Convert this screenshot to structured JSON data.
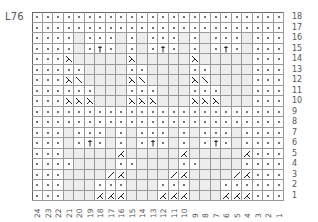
{
  "chart": {
    "label": "L76",
    "columns": 24,
    "rows": 18,
    "legend_codes": {
      "p": "purl-dot",
      "e": "empty-knit",
      "t": "arrow-up",
      "S": "left-decrease-symbol",
      "b": "backslash",
      "K": "right-decrease-symbol",
      "f": "forward-slash"
    },
    "row_labels": [
      "18",
      "17",
      "16",
      "15",
      "14",
      "13",
      "12",
      "11",
      "10",
      "9",
      "8",
      "7",
      "6",
      "5",
      "4",
      "3",
      "2",
      "1"
    ],
    "column_labels": [
      "24",
      "23",
      "22",
      "21",
      "20",
      "19",
      "18",
      "17",
      "16",
      "15",
      "14",
      "13",
      "12",
      "11",
      "10",
      "9",
      "8",
      "7",
      "6",
      "5",
      "4",
      "3",
      "2",
      "1"
    ],
    "grid": [
      "pppppppppppppppppppppppp",
      "pppppppppppppppppppppppp",
      "ppppepppepepppepepppeppp",
      "ppppeptpepeptpepeptpeppp",
      "pppSeeeeeSeeeeeSeeeeeppp",
      "pppppeeeeppeeeeppeeeeppp",
      "pppSbeeeeSbeeeeSbeeeeppp",
      "ppppppeeepppeeepppeeeppp",
      "pppSSSeeeSSSeeeSSSeeeppp",
      "pppppppppppppppppppppppp",
      "pppppppppppppppppppppppp",
      "pppepppepepppepepppepppp",
      "pppeptpepeptpepeptpepppp",
      "pppeeeeeKeeeeeKeeeeeKppp",
      "ppppeeeeppeeeeppeeeepppp",
      "pppeeeefKeeeefKeeeefKppp",
      "pppeeepppeeepppeeepppppp",
      "pppeeeKKKeeeKKKeeeKKKppp"
    ]
  }
}
